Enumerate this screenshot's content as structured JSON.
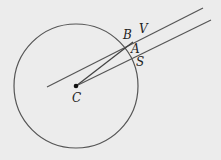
{
  "diagram": {
    "background": "#ececec",
    "stroke_color": "#555555",
    "circle": {
      "cx": 76,
      "cy": 86,
      "r": 62
    },
    "center_point": {
      "x": 76,
      "y": 86
    },
    "lines": {
      "upper": {
        "x1": 47,
        "y1": 87,
        "x2": 203,
        "y2": 8
      },
      "lower": {
        "x1": 76,
        "y1": 86,
        "x2": 211,
        "y2": 20
      },
      "segment_cb": {
        "x1": 76,
        "y1": 86,
        "x2": 133,
        "y2": 42
      }
    },
    "labels": {
      "B": "B",
      "V": "V",
      "A": "A",
      "S": "S",
      "C": "C"
    }
  }
}
